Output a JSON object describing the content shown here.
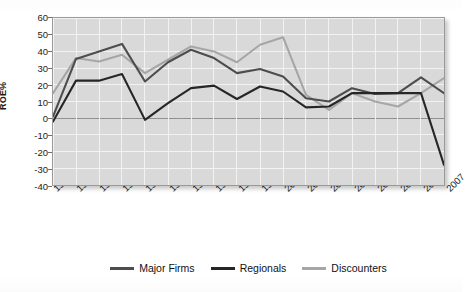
{
  "chart_data": {
    "type": "line",
    "title": "",
    "xlabel": "",
    "ylabel": "ROE%",
    "ylim": [
      -40,
      60
    ],
    "ytick_step": 10,
    "grid": true,
    "legend_position": "bottom",
    "x": [
      "1990",
      "1991",
      "1992",
      "1993",
      "1994",
      "1995",
      "1996",
      "1997",
      "1998",
      "1999",
      "2000",
      "2001",
      "2002",
      "2003",
      "2004",
      "2005",
      "2006",
      "2007"
    ],
    "yticks": [
      "60",
      "50",
      "40",
      "30",
      "20",
      "10",
      "0",
      "-10",
      "-20",
      "-30",
      "-40"
    ],
    "series": [
      {
        "name": "Major Firms",
        "color": "#4d4d4d",
        "values": [
          1,
          35.5,
          40,
          44.5,
          22,
          33.5,
          41,
          36,
          27,
          29.5,
          25,
          12,
          10,
          18,
          14.5,
          15,
          24.5,
          15
        ]
      },
      {
        "name": "Regionals",
        "color": "#262626",
        "values": [
          -2,
          22.5,
          22.5,
          26.5,
          -1,
          9,
          18,
          19.5,
          11.5,
          19,
          16,
          6.5,
          7,
          15,
          15,
          15,
          15,
          -28
        ]
      },
      {
        "name": "Discounters",
        "color": "#a6a6a6",
        "values": [
          15,
          36,
          34,
          38,
          27,
          35,
          43,
          40,
          33.5,
          44,
          48.5,
          14,
          5,
          15,
          10,
          7,
          15,
          24
        ]
      }
    ]
  },
  "axis": {
    "y_title": "ROE%"
  },
  "legend": {
    "items": [
      {
        "label": "Major Firms"
      },
      {
        "label": "Regionals"
      },
      {
        "label": "Discounters"
      }
    ]
  }
}
